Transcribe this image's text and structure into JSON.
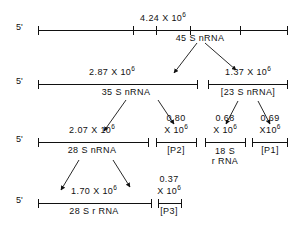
{
  "figure": {
    "type": "rrna-processing-pathway",
    "ink_color": "#111111",
    "background": "#ffffff"
  },
  "rows": [
    {
      "id": "row1",
      "five_prime": "5'",
      "segments": [
        {
          "id": "r1s1",
          "mass": "4.24 X 10",
          "mass_exp": "6",
          "name": "45 S nRNA",
          "bracketed": false
        }
      ]
    },
    {
      "id": "row2",
      "five_prime": "5'",
      "segments": [
        {
          "id": "r2s1",
          "mass": "2.87 X 10",
          "mass_exp": "6",
          "name": "35 S nRNA",
          "bracketed": false
        },
        {
          "id": "r2s2",
          "mass": "1.37 X 10",
          "mass_exp": "6",
          "name": "[23 S nRNA]",
          "bracketed": true
        }
      ]
    },
    {
      "id": "row3",
      "five_prime": "5'",
      "segments": [
        {
          "id": "r3s1",
          "mass": "2.07 X 10",
          "mass_exp": "6",
          "name": "28 S nRNA",
          "bracketed": false
        },
        {
          "id": "r3s2",
          "mass_line1": "0.80",
          "mass_line2": "X 10",
          "mass_exp": "6",
          "name": "[P2]",
          "bracketed": true
        },
        {
          "id": "r3s3",
          "mass_line1": "0.68",
          "mass_line2": "X 10",
          "mass_exp": "6",
          "name_line1": "18 S",
          "name_line2": "r RNA",
          "bracketed": false
        },
        {
          "id": "r3s4",
          "mass_line1": "0.69",
          "mass_line2": "X10",
          "mass_exp": "6",
          "name": "[P1]",
          "bracketed": true
        }
      ]
    },
    {
      "id": "row4",
      "five_prime": "5'",
      "segments": [
        {
          "id": "r4s1",
          "mass": "1.70 X 10",
          "mass_exp": "6",
          "name": "28 S r RNA",
          "bracketed": false
        },
        {
          "id": "r4s2",
          "mass_line1": "0.37",
          "mass_line2": "X 10",
          "mass_exp": "6",
          "name": "[P3]",
          "bracketed": true
        }
      ]
    }
  ],
  "arrows": [
    {
      "id": "a1",
      "from": "45 S nRNA",
      "to": "35 S nRNA"
    },
    {
      "id": "a2",
      "from": "45 S nRNA",
      "to": "[23 S nRNA]"
    },
    {
      "id": "a3",
      "from": "35 S nRNA",
      "to": "28 S nRNA"
    },
    {
      "id": "a4",
      "from": "35 S nRNA",
      "to": "[P2]"
    },
    {
      "id": "a5",
      "from": "[23 S nRNA]",
      "to": "18 S r RNA"
    },
    {
      "id": "a6",
      "from": "[23 S nRNA]",
      "to": "[P1]"
    },
    {
      "id": "a7",
      "from": "28 S nRNA",
      "to": "28 S r RNA"
    },
    {
      "id": "a8",
      "from": "28 S nRNA",
      "to": "[P3]"
    }
  ]
}
